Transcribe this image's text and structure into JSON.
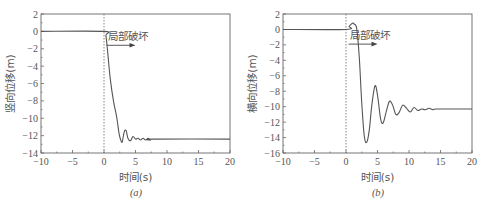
{
  "figure": {
    "captions": [
      "(a)",
      "(b)"
    ]
  },
  "chart_data": [
    {
      "type": "line",
      "panel": "(a)",
      "title": "",
      "xlabel": "时间(s)",
      "ylabel": "竖向位移(m)",
      "xlim": [
        -10,
        20
      ],
      "ylim": [
        -14,
        2
      ],
      "xticks": [
        -10,
        -5,
        0,
        5,
        10,
        15,
        20
      ],
      "yticks": [
        2,
        0,
        -2,
        -4,
        -6,
        -8,
        -10,
        -12,
        -14
      ],
      "grid": false,
      "annotations": [
        {
          "text": "局部破坏",
          "x": 0.3,
          "y": -0.8,
          "arrow": "right",
          "arrow_from": [
            0.4,
            -1.6
          ],
          "arrow_to": [
            5,
            -1.6
          ]
        },
        {
          "type": "vline",
          "x": 0,
          "style": "dotted"
        }
      ],
      "x": [
        -10,
        0,
        0.3,
        0.6,
        1.0,
        1.5,
        2.0,
        2.4,
        2.7,
        2.9,
        3.2,
        3.5,
        3.8,
        4.2,
        4.6,
        5.0,
        5.4,
        5.8,
        6.2,
        6.6,
        7.0,
        7.4,
        7.8,
        20
      ],
      "series": [
        {
          "name": "竖向位移",
          "values": [
            0,
            0,
            -0.5,
            -2.5,
            -5.5,
            -8.0,
            -9.8,
            -11.8,
            -12.6,
            -12.7,
            -11.6,
            -11.4,
            -12.3,
            -12.6,
            -12.1,
            -12.4,
            -12.3,
            -12.5,
            -12.3,
            -12.5,
            -12.3,
            -12.5,
            -12.4,
            -12.4
          ]
        }
      ]
    },
    {
      "type": "line",
      "panel": "(b)",
      "title": "",
      "xlabel": "时间(s)",
      "ylabel": "横向位移(m)",
      "xlim": [
        -10,
        20
      ],
      "ylim": [
        -16,
        2
      ],
      "xticks": [
        -10,
        -5,
        0,
        5,
        10,
        15,
        20
      ],
      "yticks": [
        2,
        0,
        -2,
        -4,
        -6,
        -8,
        -10,
        -12,
        -14,
        -16
      ],
      "grid": false,
      "annotations": [
        {
          "text": "局部破坏",
          "x": 0.3,
          "y": -1.0,
          "arrow": "right",
          "arrow_from": [
            0.4,
            -1.9
          ],
          "arrow_to": [
            5,
            -1.9
          ]
        },
        {
          "type": "vline",
          "x": 0,
          "style": "dotted"
        }
      ],
      "x": [
        -10,
        0,
        0.5,
        1.0,
        1.3,
        1.7,
        2.1,
        2.5,
        2.9,
        3.3,
        3.7,
        4.1,
        4.6,
        5.0,
        5.5,
        5.9,
        6.4,
        6.9,
        7.4,
        7.9,
        8.4,
        9.0,
        9.6,
        10.2,
        10.8,
        11.4,
        12.0,
        12.6,
        13.2,
        13.8,
        14.5,
        20
      ],
      "series": [
        {
          "name": "横向位移",
          "values": [
            0,
            0,
            0.4,
            0.8,
            0.7,
            0.1,
            -3.5,
            -9.5,
            -13.8,
            -14.6,
            -13.0,
            -9.8,
            -7.3,
            -8.5,
            -11.6,
            -12.1,
            -10.6,
            -9.3,
            -9.8,
            -11.0,
            -10.8,
            -9.8,
            -10.2,
            -10.7,
            -10.1,
            -10.5,
            -10.3,
            -10.4,
            -10.2,
            -10.4,
            -10.3,
            -10.3
          ]
        }
      ]
    }
  ]
}
